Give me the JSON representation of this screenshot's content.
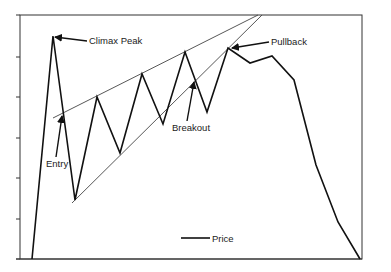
{
  "chart_data": {
    "type": "line",
    "title": "",
    "xlabel": "",
    "ylabel": "",
    "grid": false,
    "legend": {
      "position": "bottom-center",
      "entries": [
        "Price"
      ]
    },
    "axis": {
      "frame": {
        "left": 20,
        "top": 15,
        "right": 362,
        "bottom": 259
      },
      "y_ticks_px": [
        15,
        57,
        97,
        138,
        178,
        219,
        259
      ],
      "y_tick_labels": []
    },
    "series": [
      {
        "name": "Price",
        "color": "#111111",
        "points_px": [
          [
            32,
            259
          ],
          [
            53,
            36
          ],
          [
            75,
            200
          ],
          [
            97,
            97
          ],
          [
            120,
            153
          ],
          [
            142,
            74
          ],
          [
            163,
            124
          ],
          [
            185,
            52
          ],
          [
            207,
            112
          ],
          [
            228,
            48
          ],
          [
            250,
            63
          ],
          [
            272,
            56
          ],
          [
            294,
            80
          ],
          [
            316,
            165
          ],
          [
            338,
            222
          ],
          [
            360,
            259
          ]
        ]
      }
    ],
    "trendlines": [
      {
        "name": "upper-channel-line",
        "color": "#444444",
        "from": [
          53,
          118
        ],
        "to": [
          258,
          15
        ]
      },
      {
        "name": "lower-channel-line",
        "color": "#444444",
        "from": [
          72,
          203
        ],
        "to": [
          262,
          15
        ]
      }
    ],
    "annotations": [
      {
        "label": "Climax Peak",
        "text_pos": [
          89,
          44
        ],
        "arrow_from": [
          87,
          41
        ],
        "arrow_to": [
          55,
          37
        ]
      },
      {
        "label": "Entry",
        "text_pos": [
          46,
          167
        ],
        "arrow_from": [
          56,
          157
        ],
        "arrow_to": [
          62,
          116
        ]
      },
      {
        "label": "Breakout",
        "text_pos": [
          172,
          131
        ],
        "arrow_from": [
          187,
          121
        ],
        "arrow_to": [
          194,
          82
        ]
      },
      {
        "label": "Pullback",
        "text_pos": [
          271,
          45
        ],
        "arrow_from": [
          269,
          42
        ],
        "arrow_to": [
          232,
          48
        ]
      }
    ]
  },
  "legend": {
    "label": "Price",
    "line_x1": 181,
    "line_x2": 210,
    "y": 238
  }
}
